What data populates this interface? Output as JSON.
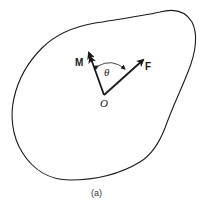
{
  "figure": {
    "caption": "(a)",
    "labels": {
      "moment": "M",
      "force": "F",
      "angle": "θ",
      "origin": "O"
    },
    "colors": {
      "stroke": "#1a1a1a",
      "background": "#ffffff"
    }
  }
}
